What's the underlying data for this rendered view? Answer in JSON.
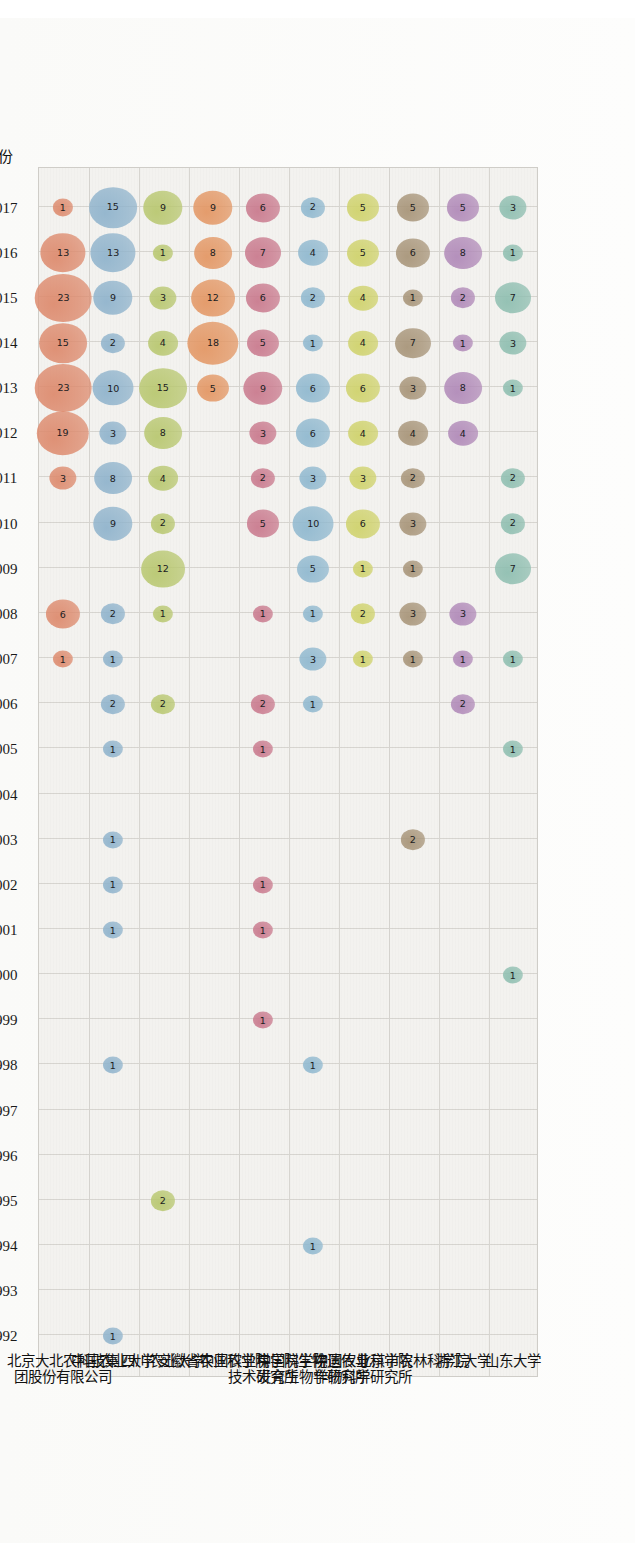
{
  "chart_data": {
    "type": "scatter",
    "subtype": "bubble-matrix",
    "title": "",
    "xlabel": "年份",
    "ylabel": "",
    "grid": true,
    "legend": "none",
    "orientation": "page rotated 90° counter-clockwise; years read bottom-to-top on the left, institutions along the bottom",
    "value_labels": "each bubble is labelled with its count",
    "x_categories": [
      "1992",
      "1993",
      "1994",
      "1995",
      "1996",
      "1997",
      "1998",
      "1999",
      "2000",
      "2001",
      "2002",
      "2003",
      "2004",
      "2005",
      "2006",
      "2007",
      "2008",
      "2009",
      "2010",
      "2011",
      "2012",
      "2013",
      "2014",
      "2015",
      "2016",
      "2017"
    ],
    "y_categories": [
      "北京大北农科技集团股份有限公司",
      "中国农业大学",
      "四川农业大学",
      "安徽省农业科学院",
      "中国农业科学院生物技术研究所",
      "中国科学院遗传与发育生物学研究所",
      "中国农业科学院作物科学研究所",
      "北京市农林科学院",
      "浙江大学",
      "山东大学"
    ],
    "series": [
      {
        "name": "北京大北农科技集团股份有限公司",
        "label_lines": [
          "北京大北农科技集",
          "团股份有限公司"
        ],
        "color": "#dd8a6d",
        "points": [
          {
            "x": "2007",
            "v": 1
          },
          {
            "x": "2008",
            "v": 6
          },
          {
            "x": "2011",
            "v": 3
          },
          {
            "x": "2012",
            "v": 19
          },
          {
            "x": "2013",
            "v": 23
          },
          {
            "x": "2014",
            "v": 15
          },
          {
            "x": "2015",
            "v": 23
          },
          {
            "x": "2016",
            "v": 13
          },
          {
            "x": "2017",
            "v": 1
          }
        ]
      },
      {
        "name": "中国农业大学",
        "label_lines": [
          "中国农业大学"
        ],
        "color": "#8fb3cc",
        "points": [
          {
            "x": "1992",
            "v": 1
          },
          {
            "x": "1998",
            "v": 1
          },
          {
            "x": "2001",
            "v": 1
          },
          {
            "x": "2002",
            "v": 1
          },
          {
            "x": "2003",
            "v": 1
          },
          {
            "x": "2005",
            "v": 1
          },
          {
            "x": "2006",
            "v": 2
          },
          {
            "x": "2007",
            "v": 1
          },
          {
            "x": "2008",
            "v": 2
          },
          {
            "x": "2010",
            "v": 9
          },
          {
            "x": "2011",
            "v": 8
          },
          {
            "x": "2012",
            "v": 3
          },
          {
            "x": "2013",
            "v": 10
          },
          {
            "x": "2014",
            "v": 2
          },
          {
            "x": "2015",
            "v": 9
          },
          {
            "x": "2016",
            "v": 13
          },
          {
            "x": "2017",
            "v": 15
          }
        ]
      },
      {
        "name": "四川农业大学",
        "label_lines": [
          "四川农业大学"
        ],
        "color": "#b8c76f",
        "points": [
          {
            "x": "1995",
            "v": 2
          },
          {
            "x": "2006",
            "v": 2
          },
          {
            "x": "2008",
            "v": 1
          },
          {
            "x": "2009",
            "v": 12
          },
          {
            "x": "2010",
            "v": 2
          },
          {
            "x": "2011",
            "v": 4
          },
          {
            "x": "2012",
            "v": 8
          },
          {
            "x": "2013",
            "v": 15
          },
          {
            "x": "2014",
            "v": 4
          },
          {
            "x": "2015",
            "v": 3
          },
          {
            "x": "2016",
            "v": 1
          },
          {
            "x": "2017",
            "v": 9
          }
        ]
      },
      {
        "name": "安徽省农业科学院",
        "label_lines": [
          "安徽省农业科学院"
        ],
        "color": "#e39663",
        "points": [
          {
            "x": "2013",
            "v": 5
          },
          {
            "x": "2014",
            "v": 18
          },
          {
            "x": "2015",
            "v": 12
          },
          {
            "x": "2016",
            "v": 8
          },
          {
            "x": "2017",
            "v": 9
          }
        ]
      },
      {
        "name": "中国农业科学院生物技术研究所",
        "label_lines": [
          "中国农业科学院生物",
          "技术研究所"
        ],
        "color": "#c9798d",
        "points": [
          {
            "x": "1999",
            "v": 1
          },
          {
            "x": "2001",
            "v": 1
          },
          {
            "x": "2002",
            "v": 1
          },
          {
            "x": "2005",
            "v": 1
          },
          {
            "x": "2006",
            "v": 2
          },
          {
            "x": "2008",
            "v": 1
          },
          {
            "x": "2010",
            "v": 5
          },
          {
            "x": "2011",
            "v": 2
          },
          {
            "x": "2012",
            "v": 3
          },
          {
            "x": "2013",
            "v": 9
          },
          {
            "x": "2014",
            "v": 5
          },
          {
            "x": "2015",
            "v": 6
          },
          {
            "x": "2016",
            "v": 7
          },
          {
            "x": "2017",
            "v": 6
          }
        ]
      },
      {
        "name": "中国科学院遗传与发育生物学研究所",
        "label_lines": [
          "中国科学院遗传与",
          "发育生物学研究所"
        ],
        "color": "#8fb8cf",
        "points": [
          {
            "x": "1994",
            "v": 1
          },
          {
            "x": "1998",
            "v": 1
          },
          {
            "x": "2006",
            "v": 1
          },
          {
            "x": "2007",
            "v": 3
          },
          {
            "x": "2008",
            "v": 1
          },
          {
            "x": "2009",
            "v": 5
          },
          {
            "x": "2010",
            "v": 10
          },
          {
            "x": "2011",
            "v": 3
          },
          {
            "x": "2012",
            "v": 6
          },
          {
            "x": "2013",
            "v": 6
          },
          {
            "x": "2014",
            "v": 1
          },
          {
            "x": "2015",
            "v": 2
          },
          {
            "x": "2016",
            "v": 4
          },
          {
            "x": "2017",
            "v": 2
          }
        ]
      },
      {
        "name": "中国农业科学院作物科学研究所",
        "label_lines": [
          "中国农业科学院",
          "作物科学研究所"
        ],
        "color": "#cfd26b",
        "points": [
          {
            "x": "2007",
            "v": 1
          },
          {
            "x": "2008",
            "v": 2
          },
          {
            "x": "2009",
            "v": 1
          },
          {
            "x": "2010",
            "v": 6
          },
          {
            "x": "2011",
            "v": 3
          },
          {
            "x": "2012",
            "v": 4
          },
          {
            "x": "2013",
            "v": 6
          },
          {
            "x": "2014",
            "v": 4
          },
          {
            "x": "2015",
            "v": 4
          },
          {
            "x": "2016",
            "v": 5
          },
          {
            "x": "2017",
            "v": 5
          }
        ]
      },
      {
        "name": "北京市农林科学院",
        "label_lines": [
          "北京市农林科学院"
        ],
        "color": "#a79478",
        "points": [
          {
            "x": "2003",
            "v": 2
          },
          {
            "x": "2007",
            "v": 1
          },
          {
            "x": "2008",
            "v": 3
          },
          {
            "x": "2009",
            "v": 1
          },
          {
            "x": "2010",
            "v": 3
          },
          {
            "x": "2011",
            "v": 2
          },
          {
            "x": "2012",
            "v": 4
          },
          {
            "x": "2013",
            "v": 3
          },
          {
            "x": "2014",
            "v": 7
          },
          {
            "x": "2015",
            "v": 1
          },
          {
            "x": "2016",
            "v": 6
          },
          {
            "x": "2017",
            "v": 5
          }
        ]
      },
      {
        "name": "浙江大学",
        "label_lines": [
          "浙江大学"
        ],
        "color": "#b089b8",
        "points": [
          {
            "x": "2006",
            "v": 2
          },
          {
            "x": "2007",
            "v": 1
          },
          {
            "x": "2008",
            "v": 3
          },
          {
            "x": "2012",
            "v": 4
          },
          {
            "x": "2013",
            "v": 8
          },
          {
            "x": "2014",
            "v": 1
          },
          {
            "x": "2015",
            "v": 2
          },
          {
            "x": "2016",
            "v": 8
          },
          {
            "x": "2017",
            "v": 5
          }
        ]
      },
      {
        "name": "山东大学",
        "label_lines": [
          "山东大学"
        ],
        "color": "#8ebeb0",
        "points": [
          {
            "x": "2000",
            "v": 1
          },
          {
            "x": "2005",
            "v": 1
          },
          {
            "x": "2007",
            "v": 1
          },
          {
            "x": "2009",
            "v": 7
          },
          {
            "x": "2010",
            "v": 2
          },
          {
            "x": "2011",
            "v": 2
          },
          {
            "x": "2013",
            "v": 1
          },
          {
            "x": "2014",
            "v": 3
          },
          {
            "x": "2015",
            "v": 7
          },
          {
            "x": "2016",
            "v": 1
          },
          {
            "x": "2017",
            "v": 3
          }
        ]
      }
    ]
  },
  "axis": {
    "x_title": "年份"
  }
}
